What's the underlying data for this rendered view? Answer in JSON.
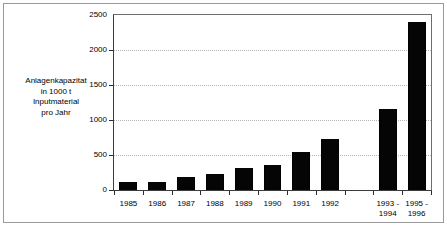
{
  "chart_data": {
    "type": "bar",
    "title": "",
    "subtitle": "",
    "xlabel": "",
    "ylabel": "Anlagenkapazitat in 1000 t Inputmaterial pro Jahr",
    "ylabel_lines": [
      "Anlagenkapazitat",
      "in 1000 t",
      "Inputmaterial",
      "pro Jahr"
    ],
    "categories": [
      "1985",
      "1986",
      "1987",
      "1988",
      "1989",
      "1990",
      "1991",
      "1992",
      "",
      "1993 -\n1994",
      "1995 -\n1996"
    ],
    "category_labels": [
      {
        "line1": "1985",
        "line2": ""
      },
      {
        "line1": "1986",
        "line2": ""
      },
      {
        "line1": "1987",
        "line2": ""
      },
      {
        "line1": "1988",
        "line2": ""
      },
      {
        "line1": "1989",
        "line2": ""
      },
      {
        "line1": "1990",
        "line2": ""
      },
      {
        "line1": "1991",
        "line2": ""
      },
      {
        "line1": "1992",
        "line2": ""
      },
      {
        "line1": "",
        "line2": ""
      },
      {
        "line1": "1993 -",
        "line2": "1994"
      },
      {
        "line1": "1995 -",
        "line2": "1996"
      }
    ],
    "values": [
      110,
      115,
      190,
      235,
      310,
      360,
      540,
      730,
      null,
      1160,
      2400
    ],
    "ylim": [
      0,
      2500
    ],
    "yticks": [
      0,
      500,
      1000,
      1500,
      2000,
      2500
    ],
    "ytick_labels": [
      "0",
      "500",
      "1000",
      "1500",
      "2000",
      "2500"
    ],
    "grid": true,
    "grid_axis": "y",
    "grid_style": "dotted",
    "legend": false,
    "bar_color": "#050505",
    "grid_color": "#b5b5b5",
    "axis_color": "#2a2a2a",
    "frame_color": "#9a9a9a",
    "background": "#ffffff"
  }
}
